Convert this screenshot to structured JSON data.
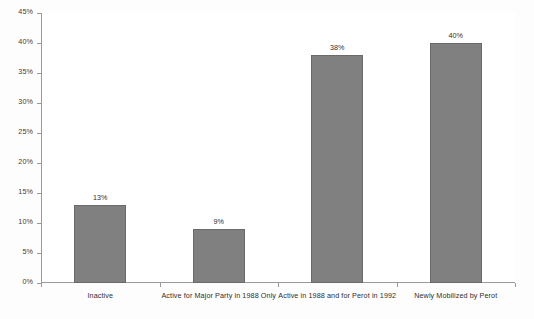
{
  "chart_data": {
    "type": "bar",
    "title": "",
    "subtitle": "",
    "xlabel": "",
    "ylabel": "",
    "categories": [
      "Inactive",
      "Active for Major Party in 1988 Only",
      "Active in 1988 and for Perot in 1992",
      "Newly Mobilized by Perot"
    ],
    "values": [
      13,
      9,
      38,
      40
    ],
    "value_labels": [
      "13%",
      "9%",
      "38%",
      "40%"
    ],
    "ylim": [
      0,
      45
    ],
    "ytick_values": [
      0,
      5,
      10,
      15,
      20,
      25,
      30,
      35,
      40,
      45
    ],
    "ytick_labels": [
      "0%",
      "5%",
      "10%",
      "15%",
      "20%",
      "25%",
      "30%",
      "35%",
      "40%",
      "45%"
    ],
    "grid": false,
    "legend": null,
    "legend_position": "none",
    "bar_color": "#808080",
    "bar_border_color": "#6a6a6a",
    "axis_color": "#9a9a9a",
    "background_color": "#ffffff"
  }
}
